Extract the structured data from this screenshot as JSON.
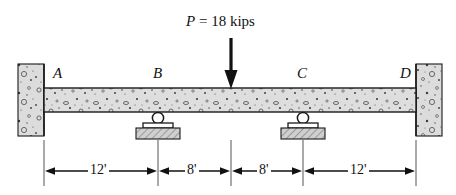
{
  "figure": {
    "background_color": "#ffffff",
    "concrete_fill": "#d9d9d9",
    "line_color": "#1a1a1a"
  },
  "load": {
    "label_symbol": "P",
    "label_rest": " = 18 kips",
    "full_label": "P = 18 kips",
    "magnitude": 18,
    "units": "kips",
    "direction": "down",
    "applied_at_x_ft": 20
  },
  "nodes": [
    {
      "id": "A",
      "label": "A",
      "support": "fixed-wall-left",
      "x_ft": 0
    },
    {
      "id": "B",
      "label": "B",
      "support": "roller",
      "x_ft": 12
    },
    {
      "id": "C",
      "label": "C",
      "support": "roller",
      "x_ft": 28
    },
    {
      "id": "D",
      "label": "D",
      "support": "fixed-wall-right",
      "x_ft": 40
    }
  ],
  "dimensions": [
    {
      "label": "12'",
      "value": 12,
      "units": "ft",
      "from": "A",
      "to": "B"
    },
    {
      "label": "8'",
      "value": 8,
      "units": "ft",
      "from": "B",
      "to": "P"
    },
    {
      "label": "8'",
      "value": 8,
      "units": "ft",
      "from": "P",
      "to": "C"
    },
    {
      "label": "12'",
      "value": 12,
      "units": "ft",
      "from": "C",
      "to": "D"
    }
  ],
  "supports": {
    "roller_label": "roller-support",
    "wall_label": "fixed-support"
  }
}
